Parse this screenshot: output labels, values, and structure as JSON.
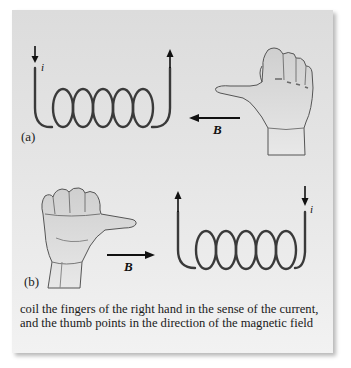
{
  "figure": {
    "part_a": {
      "label": "(a)",
      "current_label": "i",
      "field_label": "B",
      "field_direction": "left",
      "current_direction": "enters left end downward, exits right end upward",
      "coil_turns": 5
    },
    "part_b": {
      "label": "(b)",
      "current_label": "i",
      "field_label": "B",
      "field_direction": "right",
      "current_direction": "enters right end downward, exits left end upward",
      "coil_turns": 5
    },
    "caption": {
      "line1": "coil the fingers of the right hand in the sense of the current,",
      "line2": "and the thumb points in the direction of the magnetic field"
    }
  },
  "colors": {
    "panel_top": "#dcdcdc",
    "panel_bottom": "#f2f2f2",
    "wire": "#3a3a3a",
    "arrow": "#111111",
    "hand_fill": "#d8d8d8",
    "hand_outline": "#555555"
  }
}
